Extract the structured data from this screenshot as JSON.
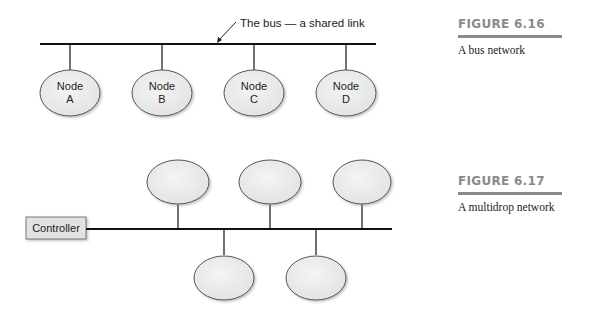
{
  "figure_6_16": {
    "number": "FIGURE 6.16",
    "caption": "A bus network",
    "bus_annotation": "The bus — a shared link",
    "nodes": [
      {
        "line1": "Node",
        "line2": "A"
      },
      {
        "line1": "Node",
        "line2": "B"
      },
      {
        "line1": "Node",
        "line2": "C"
      },
      {
        "line1": "Node",
        "line2": "D"
      }
    ]
  },
  "figure_6_17": {
    "number": "FIGURE 6.17",
    "caption": "A multidrop network",
    "controller_label": "Controller",
    "upper_node_count": 3,
    "lower_node_count": 2
  },
  "colors": {
    "node_fill": "#ececec",
    "node_stroke": "#555555",
    "line": "#111111",
    "figure_number": "#8a8a8a",
    "controller_fill": "#e2e2e2"
  }
}
